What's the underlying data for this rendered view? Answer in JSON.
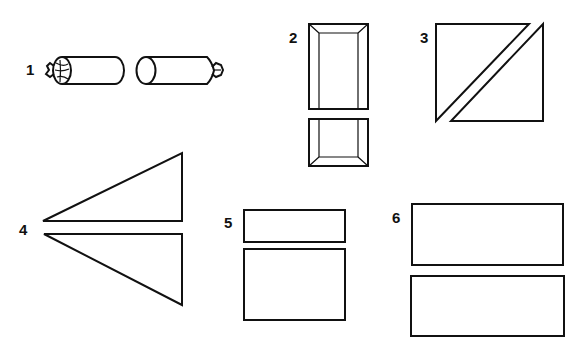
{
  "figure": {
    "background": "#ffffff",
    "ink": "#111111",
    "items": [
      {
        "number": "1",
        "shape": "two-wrapped-cylinders"
      },
      {
        "number": "2",
        "shape": "two-beveled-rectangles"
      },
      {
        "number": "3",
        "shape": "square-cut-diagonally-into-two-triangles"
      },
      {
        "number": "4",
        "shape": "two-right-triangles-mirrored"
      },
      {
        "number": "5",
        "shape": "two-stacked-rectangles-small-and-large"
      },
      {
        "number": "6",
        "shape": "two-stacked-wide-rectangles"
      }
    ]
  }
}
